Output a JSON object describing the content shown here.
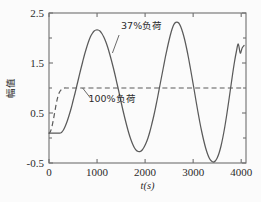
{
  "chart_data": {
    "type": "line",
    "title": "",
    "subtitle": "",
    "xlabel": "t(s)",
    "ylabel": "幅值",
    "xlim": [
      0,
      4100
    ],
    "ylim": [
      -0.5,
      2.5
    ],
    "xticks": [
      0,
      1000,
      2000,
      3000,
      4000
    ],
    "xticklabels": [
      "0",
      "1000",
      "2000",
      "3000",
      "4000"
    ],
    "yticks": [
      -0.5,
      0.5,
      1.5,
      2.5
    ],
    "yticklabels": [
      "-0.5",
      "0.5",
      "1.5",
      "2.5"
    ],
    "grid": false,
    "legend_position": "inline-annotation",
    "annotations": [
      {
        "text": "37%负荷",
        "x_data": 1500,
        "y_data": 2.18,
        "points_to_x": 1320,
        "points_to_y": 1.7
      },
      {
        "text": "100%负荷",
        "x_data": 820,
        "y_data": 0.72,
        "points_to_x": 700,
        "points_to_y": 1.0
      }
    ],
    "series": [
      {
        "name": "37%负荷",
        "style": "solid",
        "color": "#5a5a5a",
        "x": [
          0,
          60,
          120,
          180,
          240,
          260,
          300,
          340,
          380,
          420,
          460,
          500,
          540,
          580,
          620,
          660,
          700,
          740,
          780,
          820,
          860,
          900,
          940,
          980,
          1020,
          1060,
          1100,
          1140,
          1180,
          1220,
          1260,
          1300,
          1340,
          1380,
          1420,
          1460,
          1500,
          1540,
          1580,
          1620,
          1660,
          1700,
          1740,
          1780,
          1820,
          1860,
          1900,
          1940,
          1980,
          2020,
          2060,
          2100,
          2140,
          2180,
          2220,
          2260,
          2300,
          2340,
          2380,
          2420,
          2460,
          2500,
          2540,
          2580,
          2620,
          2660,
          2700,
          2740,
          2780,
          2820,
          2860,
          2900,
          2940,
          2980,
          3020,
          3060,
          3100,
          3140,
          3180,
          3220,
          3260,
          3300,
          3340,
          3380,
          3420,
          3460,
          3500,
          3540,
          3580,
          3620,
          3660,
          3700,
          3740,
          3780,
          3820,
          3860,
          3900,
          3940,
          3980,
          4020,
          4060
        ],
        "y": [
          0.1,
          0.1,
          0.1,
          0.1,
          0.1,
          0.11,
          0.16,
          0.24,
          0.34,
          0.46,
          0.59,
          0.74,
          0.89,
          1.05,
          1.21,
          1.37,
          1.52,
          1.67,
          1.8,
          1.92,
          2.02,
          2.09,
          2.14,
          2.16,
          2.16,
          2.14,
          2.09,
          2.02,
          1.93,
          1.82,
          1.69,
          1.55,
          1.4,
          1.24,
          1.07,
          0.9,
          0.72,
          0.55,
          0.39,
          0.24,
          0.1,
          -0.02,
          -0.12,
          -0.2,
          -0.25,
          -0.27,
          -0.27,
          -0.24,
          -0.18,
          -0.1,
          0.0,
          0.13,
          0.28,
          0.44,
          0.62,
          0.81,
          1.01,
          1.21,
          1.41,
          1.61,
          1.79,
          1.96,
          2.11,
          2.23,
          2.3,
          2.32,
          2.3,
          2.23,
          2.12,
          1.98,
          1.81,
          1.62,
          1.41,
          1.19,
          0.97,
          0.74,
          0.52,
          0.31,
          0.12,
          -0.05,
          -0.2,
          -0.32,
          -0.41,
          -0.46,
          -0.48,
          -0.46,
          -0.4,
          -0.3,
          -0.16,
          0.02,
          0.23,
          0.47,
          0.73,
          1.0,
          1.27,
          1.52,
          1.73,
          1.88,
          1.7,
          1.8,
          1.85
        ]
      },
      {
        "name": "100%负荷",
        "style": "dashed",
        "color": "#5a5a5a",
        "x": [
          0,
          30,
          60,
          90,
          120,
          150,
          180,
          210,
          240,
          280,
          320,
          360,
          400,
          460,
          520,
          600,
          700,
          900,
          1200,
          1600,
          2000,
          2400,
          2800,
          3200,
          3600,
          4000,
          4060
        ],
        "y": [
          0.09,
          0.13,
          0.22,
          0.36,
          0.52,
          0.68,
          0.81,
          0.9,
          0.95,
          0.99,
          1.0,
          1.0,
          1.0,
          1.0,
          1.0,
          1.0,
          1.0,
          1.0,
          1.0,
          1.0,
          1.0,
          1.0,
          1.0,
          1.0,
          1.0,
          1.0,
          1.0
        ]
      }
    ]
  }
}
